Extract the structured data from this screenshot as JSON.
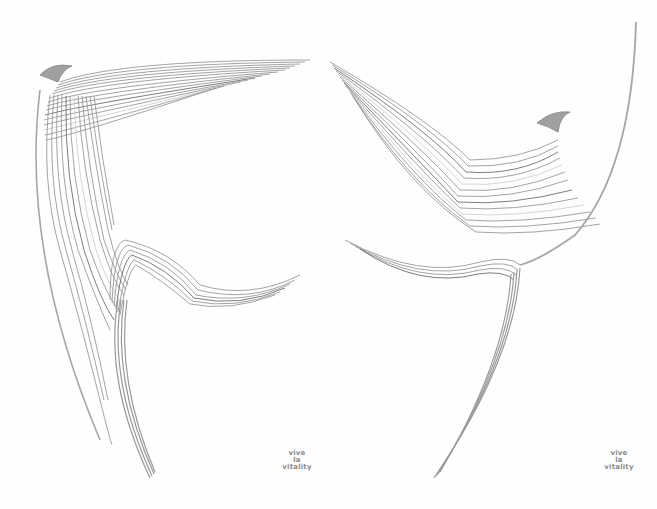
{
  "artwork": {
    "subject": "two abstract line-art birds",
    "stroke_color": "#9a9a9a",
    "dark_stroke_color": "#6e6e6e",
    "light_stroke_color": "#d6d6d6",
    "background_color": "#fefefe"
  },
  "captions": [
    {
      "line1": "vive",
      "line2": "la",
      "line3": "vitality"
    },
    {
      "line1": "vive",
      "line2": "la",
      "line3": "vitality"
    }
  ]
}
